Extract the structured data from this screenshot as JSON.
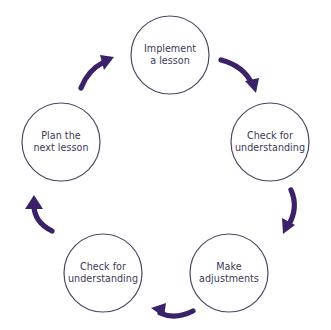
{
  "diagram": {
    "type": "cycle",
    "title": "",
    "colors": {
      "circle_stroke": "#4a4864",
      "arrow": "#3a2268",
      "text": "#3d3a55",
      "background": "#ffffff"
    },
    "nodes": [
      {
        "id": "implement-a-lesson",
        "label": "Implement\na lesson",
        "cx": 170,
        "cy": 55,
        "r": 39
      },
      {
        "id": "check-for-understanding-right",
        "label": "Check for\nunderstanding",
        "cx": 270,
        "cy": 142,
        "r": 39
      },
      {
        "id": "make-adjustments",
        "label": "Make\nadjustments",
        "cx": 229,
        "cy": 273,
        "r": 39
      },
      {
        "id": "check-for-understanding-left",
        "label": "Check for\nunderstanding",
        "cx": 103,
        "cy": 273,
        "r": 39
      },
      {
        "id": "plan-the-next-lesson",
        "label": "Plan the\nnext lesson",
        "cx": 61,
        "cy": 142,
        "r": 39
      }
    ],
    "arrows": [
      {
        "id": "arrow-implement-to-check-right",
        "from": "implement-a-lesson",
        "to": "check-for-understanding-right",
        "direction": "clockwise"
      },
      {
        "id": "arrow-check-right-to-make-adjustments",
        "from": "check-for-understanding-right",
        "to": "make-adjustments",
        "direction": "clockwise"
      },
      {
        "id": "arrow-make-adjustments-to-check-left",
        "from": "make-adjustments",
        "to": "check-for-understanding-left",
        "direction": "clockwise"
      },
      {
        "id": "arrow-check-left-to-plan",
        "from": "check-for-understanding-left",
        "to": "plan-the-next-lesson",
        "direction": "clockwise"
      },
      {
        "id": "arrow-plan-to-implement",
        "from": "plan-the-next-lesson",
        "to": "implement-a-lesson",
        "direction": "clockwise"
      }
    ]
  }
}
